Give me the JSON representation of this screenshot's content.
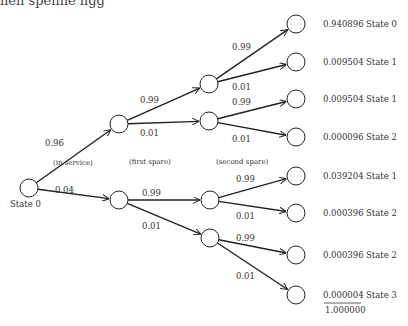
{
  "top_fragment": "nen spenne ngg",
  "stage_labels": {
    "in_service": "(in service)",
    "first_spare": "(first spare)",
    "second_spare": "(second spare)"
  },
  "root_label": "State 0",
  "nodes": {
    "root": {
      "x": 29,
      "y": 188
    },
    "l1": [
      {
        "x": 119,
        "y": 124
      },
      {
        "x": 119,
        "y": 200
      }
    ],
    "l2": [
      {
        "x": 209,
        "y": 84
      },
      {
        "x": 209,
        "y": 121
      },
      {
        "x": 210,
        "y": 200
      },
      {
        "x": 210,
        "y": 238
      }
    ],
    "leaves": [
      {
        "x": 296,
        "y": 24,
        "prob": "0.940896",
        "state": "State 0"
      },
      {
        "x": 296,
        "y": 62,
        "prob": "0.009504",
        "state": "State 1"
      },
      {
        "x": 296,
        "y": 99,
        "prob": "0.009504",
        "state": "State 1"
      },
      {
        "x": 296,
        "y": 137,
        "prob": "0.000096",
        "state": "State 2"
      },
      {
        "x": 296,
        "y": 176,
        "prob": "0.039204",
        "state": "State 1"
      },
      {
        "x": 296,
        "y": 213,
        "prob": "0.000396",
        "state": "State 2"
      },
      {
        "x": 296,
        "y": 255,
        "prob": "0.000396",
        "state": "State 2"
      },
      {
        "x": 296,
        "y": 295,
        "prob": "0.000004",
        "state": "State 3"
      }
    ]
  },
  "edges": [
    {
      "from": "root",
      "to": "l1.0",
      "label": "0.96",
      "lx": 45,
      "ly": 146
    },
    {
      "from": "root",
      "to": "l1.1",
      "label": "0.04",
      "lx": 55,
      "ly": 193
    },
    {
      "from": "l1.0",
      "to": "l2.0",
      "label": "0.99",
      "lx": 140,
      "ly": 103
    },
    {
      "from": "l1.0",
      "to": "l2.1",
      "label": "0.01",
      "lx": 140,
      "ly": 136
    },
    {
      "from": "l1.1",
      "to": "l2.2",
      "label": "0.99",
      "lx": 142,
      "ly": 196
    },
    {
      "from": "l1.1",
      "to": "l2.3",
      "label": "0.01",
      "lx": 142,
      "ly": 229
    },
    {
      "from": "l2.0",
      "to": "leaf.0",
      "label": "0.99",
      "lx": 232,
      "ly": 50
    },
    {
      "from": "l2.0",
      "to": "leaf.1",
      "label": "0.01",
      "lx": 232,
      "ly": 90
    },
    {
      "from": "l2.1",
      "to": "leaf.2",
      "label": "0.99",
      "lx": 232,
      "ly": 105
    },
    {
      "from": "l2.1",
      "to": "leaf.3",
      "label": "0.01",
      "lx": 232,
      "ly": 142
    },
    {
      "from": "l2.2",
      "to": "leaf.4",
      "label": "0.99",
      "lx": 236,
      "ly": 182
    },
    {
      "from": "l2.2",
      "to": "leaf.5",
      "label": "0.01",
      "lx": 236,
      "ly": 219
    },
    {
      "from": "l2.3",
      "to": "leaf.6",
      "label": "0.99",
      "lx": 236,
      "ly": 241
    },
    {
      "from": "l2.3",
      "to": "leaf.7",
      "label": "0.01",
      "lx": 236,
      "ly": 279
    }
  ],
  "total": "1.000000",
  "node_radius": 9,
  "colors": {
    "line": "#222222",
    "text": "#333333",
    "background": "#ffffff"
  }
}
